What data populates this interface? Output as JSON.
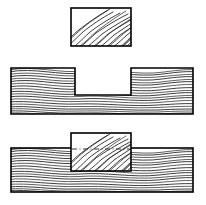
{
  "figure": {
    "background_color": "#ffffff",
    "line_color": "#000000",
    "grain_color": "#1a1a1a",
    "width": 206,
    "height": 205,
    "parts": [
      {
        "id": "block",
        "label": "Block (tenon piece)",
        "view": "front elevation",
        "grain_direction": "diagonal",
        "x": 71,
        "y": 8,
        "width": 60,
        "height": 38
      },
      {
        "id": "notched-board",
        "label": "Board with notch (mortise)",
        "view": "front elevation",
        "grain_direction": "horizontal",
        "x": 11,
        "y": 68,
        "width": 182,
        "height": 46,
        "notch": {
          "label": "Notch / dado",
          "x": 75,
          "y": 68,
          "width": 56,
          "height": 27
        }
      },
      {
        "id": "assembly",
        "label": "Assembled joint",
        "view": "front elevation",
        "grain_direction": "horizontal",
        "x": 11,
        "y": 148,
        "width": 182,
        "height": 44,
        "inserted_block": {
          "label": "Block seated in notch",
          "grain_direction": "diagonal",
          "x": 71,
          "y": 133,
          "width": 60,
          "height": 38
        },
        "hidden_edge_label": "Hidden board surface line"
      }
    ]
  }
}
